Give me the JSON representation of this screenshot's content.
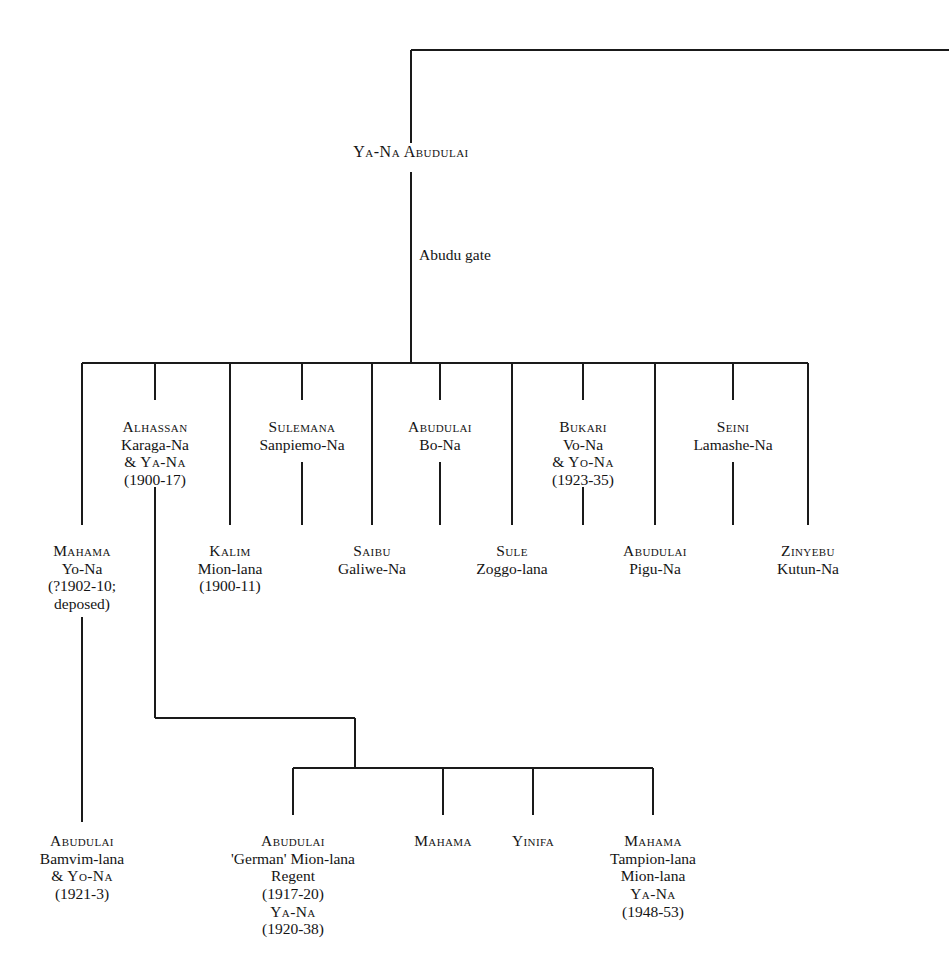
{
  "diagram": {
    "title": "Abudu gate",
    "root": {
      "id": "ya-na-abudulai",
      "label": "Ya-Na Abudulai",
      "x": 411,
      "y": 154
    },
    "gate_label": {
      "id": "abudu-gate",
      "label": "Abudu gate",
      "x": 419,
      "y": 256
    },
    "generation_2": [
      {
        "id": "alhassan",
        "x": 155,
        "y": 418,
        "lines": [
          {
            "text": "Alhassan",
            "smallcaps": true
          },
          {
            "text": "Karaga-Na",
            "smallcaps": false
          },
          {
            "text": "& Ya-Na",
            "smallcaps": true
          },
          {
            "text": "(1900-17)",
            "smallcaps": false
          }
        ]
      },
      {
        "id": "sulemana",
        "x": 302,
        "y": 418,
        "lines": [
          {
            "text": "Sulemana",
            "smallcaps": true
          },
          {
            "text": "Sanpiemo-Na",
            "smallcaps": false
          }
        ]
      },
      {
        "id": "abudulai-bo-na",
        "x": 440,
        "y": 418,
        "lines": [
          {
            "text": "Abudulai",
            "smallcaps": true
          },
          {
            "text": "Bo-Na",
            "smallcaps": false
          }
        ]
      },
      {
        "id": "bukari",
        "x": 583,
        "y": 418,
        "lines": [
          {
            "text": "Bukari",
            "smallcaps": true
          },
          {
            "text": "Vo-Na",
            "smallcaps": false
          },
          {
            "text": "& Yo-Na",
            "smallcaps": true
          },
          {
            "text": "(1923-35)",
            "smallcaps": false
          }
        ]
      },
      {
        "id": "seini",
        "x": 733,
        "y": 418,
        "lines": [
          {
            "text": "Seini",
            "smallcaps": true
          },
          {
            "text": "Lamashe-Na",
            "smallcaps": false
          }
        ]
      }
    ],
    "generation_3": [
      {
        "id": "mahama-yo-na",
        "x": 82,
        "y": 542,
        "lines": [
          {
            "text": "Mahama",
            "smallcaps": true
          },
          {
            "text": "Yo-Na",
            "smallcaps": false
          },
          {
            "text": "(?1902-10;",
            "smallcaps": false
          },
          {
            "text": "deposed)",
            "smallcaps": false
          }
        ]
      },
      {
        "id": "kalim",
        "x": 230,
        "y": 542,
        "lines": [
          {
            "text": "Kalim",
            "smallcaps": true
          },
          {
            "text": "Mion-lana",
            "smallcaps": false
          },
          {
            "text": "(1900-11)",
            "smallcaps": false
          }
        ]
      },
      {
        "id": "saibu",
        "x": 372,
        "y": 542,
        "lines": [
          {
            "text": "Saibu",
            "smallcaps": true
          },
          {
            "text": "Galiwe-Na",
            "smallcaps": false
          }
        ]
      },
      {
        "id": "sule",
        "x": 512,
        "y": 542,
        "lines": [
          {
            "text": "Sule",
            "smallcaps": true
          },
          {
            "text": "Zoggo-lana",
            "smallcaps": false
          }
        ]
      },
      {
        "id": "abudulai-pigu-na",
        "x": 655,
        "y": 542,
        "lines": [
          {
            "text": "Abudulai",
            "smallcaps": true
          },
          {
            "text": "Pigu-Na",
            "smallcaps": false
          }
        ]
      },
      {
        "id": "zinyebu",
        "x": 808,
        "y": 542,
        "lines": [
          {
            "text": "Zinyebu",
            "smallcaps": true
          },
          {
            "text": "Kutun-Na",
            "smallcaps": false
          }
        ]
      }
    ],
    "generation_4": [
      {
        "id": "abudulai-bamvim-lana",
        "x": 82,
        "y": 832,
        "lines": [
          {
            "text": "Abudulai",
            "smallcaps": true
          },
          {
            "text": "Bamvim-lana",
            "smallcaps": false
          },
          {
            "text": "& Yo-Na",
            "smallcaps": true
          },
          {
            "text": "(1921-3)",
            "smallcaps": false
          }
        ]
      },
      {
        "id": "abudulai-german",
        "x": 293,
        "y": 832,
        "lines": [
          {
            "text": "Abudulai",
            "smallcaps": true
          },
          {
            "text": "'German' Mion-lana",
            "smallcaps": false
          },
          {
            "text": "Regent",
            "smallcaps": false
          },
          {
            "text": "(1917-20)",
            "smallcaps": false
          },
          {
            "text": "Ya-Na",
            "smallcaps": true
          },
          {
            "text": "(1920-38)",
            "smallcaps": false
          }
        ]
      },
      {
        "id": "mahama-plain",
        "x": 443,
        "y": 832,
        "lines": [
          {
            "text": "Mahama",
            "smallcaps": true
          }
        ]
      },
      {
        "id": "yinifa",
        "x": 533,
        "y": 832,
        "lines": [
          {
            "text": "Yinifa",
            "smallcaps": true
          }
        ]
      },
      {
        "id": "mahama-tampion-lana",
        "x": 653,
        "y": 832,
        "lines": [
          {
            "text": "Mahama",
            "smallcaps": true
          },
          {
            "text": "Tampion-lana",
            "smallcaps": false
          },
          {
            "text": "Mion-lana",
            "smallcaps": false
          },
          {
            "text": "Ya-Na",
            "smallcaps": true
          },
          {
            "text": "(1948-53)",
            "smallcaps": false
          }
        ]
      }
    ],
    "style": {
      "line_color": "#1a1a1a",
      "line_width": 1.6,
      "background": "#ffffff",
      "text_color": "#141414"
    },
    "connectors": {
      "top_bar_y": 50,
      "top_bar_x_start": 411,
      "top_bar_x_end": 949,
      "trunk_x": 411,
      "trunk_top_y": 50,
      "trunk_text_gap_top": 143,
      "trunk_text_gap_bottom": 172,
      "trunk_bottom_y": 363,
      "main_bar_y": 363,
      "main_bar_x_start": 82,
      "main_bar_x_end": 808,
      "drop_x_positions": [
        82,
        155,
        230,
        302,
        372,
        440,
        512,
        583,
        655,
        733,
        808
      ],
      "gen2_drop_bottom_y": 400,
      "gen3_drop_bottom_y": 525,
      "alhassan_stem_x": 155,
      "alhassan_stem_bottom_y": 718,
      "alhassan_elbow_x": 355,
      "sub_bar_y": 768,
      "sub_bar_x_start": 293,
      "sub_bar_x_end": 653,
      "sub_drop_x_positions": [
        293,
        443,
        533,
        653
      ],
      "sub_drop_bottom_y": 815,
      "mahama_stem_x": 82,
      "mahama_stem_top_y": 617,
      "mahama_stem_bottom_y": 822
    }
  }
}
